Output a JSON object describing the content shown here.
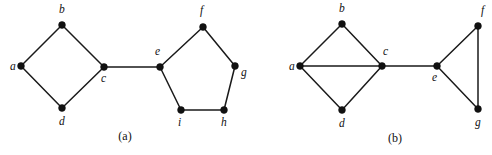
{
  "figure": {
    "width": 492,
    "height": 155,
    "background": "#ffffff",
    "ink_color": "#111111",
    "edge_color": "#1a1a1a"
  },
  "panels": [
    {
      "id": "panel-a",
      "caption": "(a)",
      "caption_position": {
        "x": 125,
        "y": 140
      },
      "vertices": [
        {
          "id": "a",
          "label": "a",
          "x": 21,
          "y": 66,
          "label_x": 10,
          "label_y": 70
        },
        {
          "id": "b",
          "label": "b",
          "x": 62,
          "y": 25,
          "label_x": 59,
          "label_y": 13
        },
        {
          "id": "c",
          "label": "c",
          "x": 104,
          "y": 67,
          "label_x": 101,
          "label_y": 82
        },
        {
          "id": "d",
          "label": "d",
          "x": 62,
          "y": 108,
          "label_x": 59,
          "label_y": 125
        },
        {
          "id": "e",
          "label": "e",
          "x": 160,
          "y": 67,
          "label_x": 155,
          "label_y": 55
        },
        {
          "id": "f",
          "label": "f",
          "x": 203,
          "y": 27,
          "label_x": 200,
          "label_y": 14
        },
        {
          "id": "g",
          "label": "g",
          "x": 235,
          "y": 66,
          "label_x": 241,
          "label_y": 76
        },
        {
          "id": "h",
          "label": "h",
          "x": 224,
          "y": 110,
          "label_x": 221,
          "label_y": 126
        },
        {
          "id": "i",
          "label": "i",
          "x": 181,
          "y": 110,
          "label_x": 178,
          "label_y": 126
        }
      ],
      "edges": [
        {
          "from": "a",
          "to": "b"
        },
        {
          "from": "b",
          "to": "c"
        },
        {
          "from": "a",
          "to": "d"
        },
        {
          "from": "d",
          "to": "c"
        },
        {
          "from": "c",
          "to": "e"
        },
        {
          "from": "e",
          "to": "f"
        },
        {
          "from": "f",
          "to": "g"
        },
        {
          "from": "g",
          "to": "h"
        },
        {
          "from": "h",
          "to": "i"
        },
        {
          "from": "i",
          "to": "e"
        }
      ]
    },
    {
      "id": "panel-b",
      "caption": "(b)",
      "caption_position": {
        "x": 395,
        "y": 142
      },
      "vertices": [
        {
          "id": "a",
          "label": "a",
          "x": 300,
          "y": 66,
          "label_x": 289,
          "label_y": 70
        },
        {
          "id": "b",
          "label": "b",
          "x": 342,
          "y": 24,
          "label_x": 339,
          "label_y": 12
        },
        {
          "id": "c",
          "label": "c",
          "x": 382,
          "y": 66,
          "label_x": 383,
          "label_y": 55
        },
        {
          "id": "d",
          "label": "d",
          "x": 342,
          "y": 110,
          "label_x": 339,
          "label_y": 127
        },
        {
          "id": "e",
          "label": "e",
          "x": 437,
          "y": 66,
          "label_x": 432,
          "label_y": 81
        },
        {
          "id": "f",
          "label": "f",
          "x": 478,
          "y": 26,
          "label_x": 481,
          "label_y": 14
        },
        {
          "id": "g",
          "label": "g",
          "x": 478,
          "y": 109,
          "label_x": 475,
          "label_y": 126
        }
      ],
      "edges": [
        {
          "from": "a",
          "to": "b"
        },
        {
          "from": "b",
          "to": "c"
        },
        {
          "from": "a",
          "to": "c"
        },
        {
          "from": "a",
          "to": "d"
        },
        {
          "from": "d",
          "to": "c"
        },
        {
          "from": "c",
          "to": "e"
        },
        {
          "from": "e",
          "to": "f"
        },
        {
          "from": "e",
          "to": "g"
        },
        {
          "from": "f",
          "to": "g"
        }
      ]
    }
  ],
  "vertex_radius": 3.4
}
